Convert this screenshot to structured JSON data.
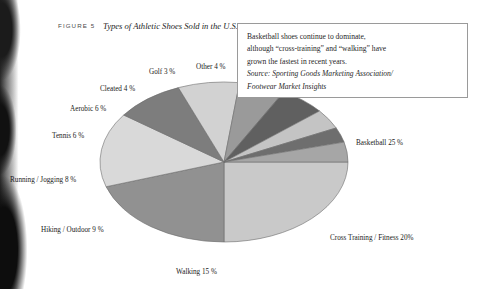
{
  "figure": {
    "label": "FIGURE 5",
    "title": "Types of Athletic Shoes Sold in the U.S., 1996"
  },
  "note": {
    "lines": [
      "Basketball shoes continue to dominate,",
      "although “cross-training” and “walking” have",
      "grown the fastest in recent years."
    ],
    "source_lines": [
      "Source: Sporting Goods Marketing Association/",
      "Footwear Market Insights"
    ]
  },
  "chart_data": {
    "type": "pie",
    "title": "Types of Athletic Shoes Sold in the U.S., 1996",
    "xlabel": "",
    "ylabel": "",
    "units": "percent",
    "legend": "none",
    "grid": false,
    "categories": [
      "Basketball",
      "Cross Training / Fitness",
      "Walking",
      "Hiking / Outdoor",
      "Running / Jogging",
      "Tennis",
      "Aerobic",
      "Cleated",
      "Golf",
      "Other"
    ],
    "values": [
      25,
      20,
      15,
      9,
      8,
      6,
      6,
      4,
      3,
      4
    ],
    "labels": [
      "Basketball 25 %",
      "Cross Training / Fitness 20%",
      "Walking 15 %",
      "Hiking / Outdoor  9 %",
      "Running / Jogging  8 %",
      "Tennis 6 %",
      "Aerobic 6 %",
      "Cleated 4 %",
      "Golf 3 %",
      "Other 4 %"
    ],
    "colors": [
      "#c9c9c9",
      "#919191",
      "#d9d9d9",
      "#7d7d7d",
      "#d2d2d2",
      "#9a9a9a",
      "#606060",
      "#c4c4c4",
      "#6e6e6e",
      "#a6a6a6"
    ],
    "start_angle_deg": 0,
    "direction": "clockwise",
    "center": [
      224,
      162
    ],
    "radius_x": 124,
    "radius_y": 80
  },
  "label_positions": [
    {
      "name": "basketball",
      "x": 356,
      "y": 139
    },
    {
      "name": "cross-training",
      "x": 330,
      "y": 234
    },
    {
      "name": "walking",
      "x": 176,
      "y": 268
    },
    {
      "name": "hiking",
      "x": 41,
      "y": 226
    },
    {
      "name": "running",
      "x": 10,
      "y": 176
    },
    {
      "name": "tennis",
      "x": 52,
      "y": 132
    },
    {
      "name": "aerobic",
      "x": 70,
      "y": 105
    },
    {
      "name": "cleated",
      "x": 100,
      "y": 85
    },
    {
      "name": "golf",
      "x": 149,
      "y": 68
    },
    {
      "name": "other",
      "x": 196,
      "y": 63
    }
  ]
}
